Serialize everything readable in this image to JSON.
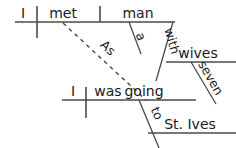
{
  "diagram": {
    "type": "reed-kellogg-sentence-diagram",
    "sentence": "As I was going to St. Ives I met a man with seven wives",
    "stroke_color": "#4a4a4a",
    "text_color": "#1a1a1a",
    "background_color": "#ffffff",
    "clauses": [
      {
        "name": "main-clause",
        "baseline_y": 22,
        "subject": "I",
        "verb": "met",
        "direct_object": "man",
        "modifiers": [
          {
            "word": "a",
            "attaches_to": "man",
            "kind": "article"
          },
          {
            "word": "with",
            "attaches_to": "man",
            "kind": "preposition"
          },
          {
            "word": "wives",
            "attaches_to": "with",
            "kind": "object-of-preposition"
          },
          {
            "word": "seven",
            "attaches_to": "wives",
            "kind": "adjective"
          }
        ]
      },
      {
        "name": "subordinate-clause",
        "baseline_y": 100,
        "subject": "I",
        "verb": "was going",
        "modifiers": [
          {
            "word": "to",
            "attaches_to": "was going",
            "kind": "preposition"
          },
          {
            "word": "St. Ives",
            "attaches_to": "to",
            "kind": "object-of-preposition"
          }
        ]
      }
    ],
    "connector": {
      "word": "As",
      "style": "dashed",
      "from": "met",
      "to": "was going"
    },
    "labels": {
      "subject_main": "I",
      "verb_main": "met",
      "object_main": "man",
      "article_a": "a",
      "prep_with": "with",
      "obj_wives": "wives",
      "adj_seven": "seven",
      "conj_as": "As",
      "subject_sub": "I",
      "verb_sub_aux": "was",
      "verb_sub_main": "going",
      "prep_to": "to",
      "obj_stives": "St. Ives"
    }
  }
}
